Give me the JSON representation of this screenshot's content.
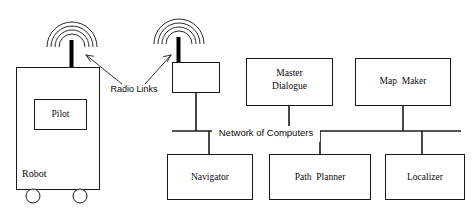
{
  "diagram": {
    "stroke_color": "#1a1a1a",
    "mast_color": "#000000",
    "background": "#ffffff",
    "robot": {
      "body_name": "Robot",
      "inner_name": "Pilot",
      "wheel_count": 2
    },
    "radio": {
      "label": "Radio Links",
      "antenna_count": 2,
      "arc_count": 4
    },
    "base_station": {
      "label": ""
    },
    "bus": {
      "label": "Network of Computers"
    },
    "top_nodes": [
      {
        "id": "master-dialogue",
        "line1": "Master",
        "line2": "Dialogue"
      },
      {
        "id": "map-maker",
        "line1": "Map  Maker",
        "line2": ""
      }
    ],
    "bottom_nodes": [
      {
        "id": "navigator",
        "label": "Navigator"
      },
      {
        "id": "path-planner",
        "label": "Path  Planner"
      },
      {
        "id": "localizer",
        "label": "Localizer"
      }
    ]
  }
}
